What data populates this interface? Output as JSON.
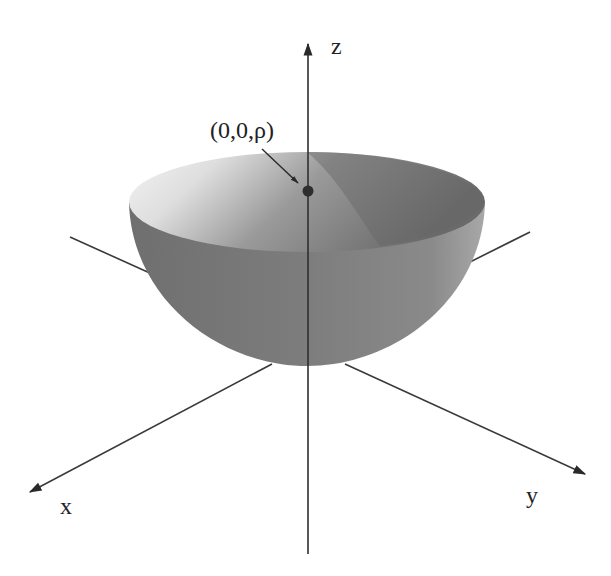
{
  "figure": {
    "axes": {
      "z_label": "z",
      "x_label": "x",
      "y_label": "y"
    },
    "point_annotation": "(0,0,ρ)",
    "colors": {
      "axis": "#3a3a3a",
      "bowl_outer": "#7b7b7b",
      "bowl_inner_light": "#f0f0f0",
      "bowl_inner_dark": "#6e6e6e",
      "point": "#333333",
      "background": "#ffffff"
    }
  }
}
